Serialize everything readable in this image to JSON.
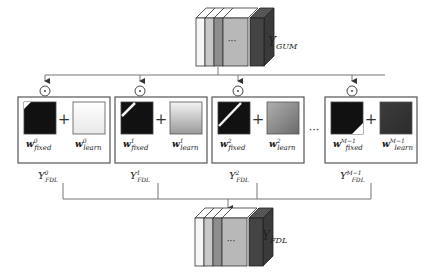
{
  "diagram": {
    "input_stack_label": "Y",
    "input_stack_sub": "GUM",
    "output_stack_label": "Y",
    "output_stack_sub": "FDL",
    "operator_symbol": "⊙",
    "plus_symbol": "+",
    "ellipsis": "···",
    "stack_ellipsis": "···",
    "branches": [
      {
        "fixed_w": "w",
        "fixed_sup": "0",
        "fixed_sub": "fixed",
        "learn_w": "w",
        "learn_sup": "0",
        "learn_sub": "learn",
        "out_label": "Y",
        "out_sup": "0",
        "out_sub": "FDL",
        "fixed_pattern": "corner-top-left-small",
        "learn_gradient": [
          "#ffffff",
          "#e8e8e8"
        ]
      },
      {
        "fixed_w": "w",
        "fixed_sup": "1",
        "fixed_sub": "fixed",
        "learn_w": "w",
        "learn_sup": "1",
        "learn_sub": "learn",
        "out_label": "Y",
        "out_sup": "1",
        "out_sub": "FDL",
        "fixed_pattern": "diagonal-band-short",
        "learn_gradient": [
          "#f4f4f4",
          "#9a9a9a"
        ]
      },
      {
        "fixed_w": "w",
        "fixed_sup": "2",
        "fixed_sub": "fixed",
        "learn_w": "w",
        "learn_sup": "2",
        "learn_sub": "learn",
        "out_label": "Y",
        "out_sup": "2",
        "out_sub": "FDL",
        "fixed_pattern": "diagonal-band-long",
        "learn_gradient": [
          "#b0b0b0",
          "#6a6a6a"
        ]
      },
      {
        "fixed_w": "w",
        "fixed_sup": "M−1",
        "fixed_sub": "fixed",
        "learn_w": "w",
        "learn_sup": "M−1",
        "learn_sub": "learn",
        "out_label": "Y",
        "out_sup": "M−1",
        "out_sub": "FDL",
        "fixed_pattern": "corner-bottom-right",
        "learn_gradient": [
          "#3c3c3c",
          "#2c2c2c"
        ]
      }
    ]
  }
}
